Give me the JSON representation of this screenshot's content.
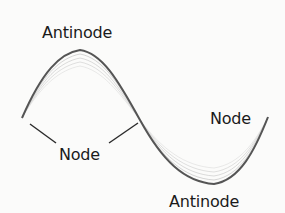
{
  "diagram": {
    "labels": {
      "antinode_top": "Antinode",
      "node_center": "Node",
      "node_right": "Node",
      "antinode_bottom": "Antinode"
    },
    "colors": {
      "wave": "#555555",
      "wave_faint": "#a8a8a8",
      "leader_line": "#2a2a2a",
      "text": "#1a1a1a",
      "background": "#fbfbfa"
    }
  }
}
